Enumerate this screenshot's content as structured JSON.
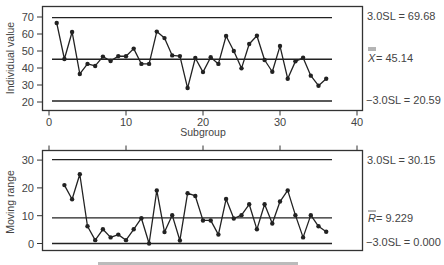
{
  "chart_data": [
    {
      "type": "line",
      "title": "Individuals chart",
      "xlabel": "Subgroup",
      "ylabel": "Individual value",
      "xlim": [
        0,
        40
      ],
      "ylim": [
        18,
        72
      ],
      "x_ticks": [
        0,
        10,
        20,
        30,
        40
      ],
      "y_ticks": [
        20,
        30,
        40,
        50,
        60,
        70
      ],
      "grid": false,
      "x": [
        1,
        2,
        3,
        4,
        5,
        6,
        7,
        8,
        9,
        10,
        11,
        12,
        13,
        14,
        15,
        16,
        17,
        18,
        19,
        20,
        21,
        22,
        23,
        24,
        25,
        26,
        27,
        28,
        29,
        30,
        31,
        32,
        33,
        34,
        35,
        36
      ],
      "values": [
        66.5,
        45.3,
        61.2,
        36.5,
        42.4,
        41.2,
        46.7,
        44.1,
        47.0,
        46.9,
        51.4,
        42.4,
        42.4,
        61.4,
        57.6,
        47.4,
        47.0,
        28.2,
        45.9,
        37.6,
        46.3,
        42.4,
        58.8,
        50.0,
        39.8,
        54.1,
        59.0,
        44.7,
        37.8,
        52.9,
        33.7,
        43.9,
        46.0,
        35.5,
        29.6,
        33.7
      ],
      "control_limits": {
        "ucl": {
          "label": "3.0SL = 69.68",
          "value": 69.68
        },
        "center": {
          "label": "X̿ = 45.14",
          "symbol": "X",
          "text": " = 45.14",
          "value": 45.14
        },
        "lcl": {
          "label": "−3.0SL = 20.59",
          "value": 20.59
        }
      }
    },
    {
      "type": "line",
      "title": "Moving range chart",
      "xlabel": "Subgroup",
      "ylabel": "Moving range",
      "xlim": [
        0,
        40
      ],
      "ylim": [
        -1,
        33
      ],
      "y_ticks": [
        0,
        10,
        20,
        30
      ],
      "grid": false,
      "x": [
        2,
        3,
        4,
        5,
        6,
        7,
        8,
        9,
        10,
        11,
        12,
        13,
        14,
        15,
        16,
        17,
        18,
        19,
        20,
        21,
        22,
        23,
        24,
        25,
        26,
        27,
        28,
        29,
        30,
        31,
        32,
        33,
        34,
        35,
        36
      ],
      "values": [
        21.0,
        15.9,
        24.9,
        6.2,
        1.2,
        5.1,
        2.2,
        3.2,
        1.2,
        5.1,
        9.1,
        0.0,
        19.1,
        4.1,
        10.2,
        1.1,
        18.1,
        17.1,
        8.3,
        8.3,
        3.2,
        16.0,
        9.0,
        10.2,
        14.1,
        5.1,
        14.1,
        7.2,
        15.1,
        19.1,
        10.2,
        2.2,
        10.2,
        6.2,
        4.2
      ],
      "control_limits": {
        "ucl": {
          "label": "3.0SL = 30.15",
          "value": 30.15
        },
        "center": {
          "label": "R̄ = 9.229",
          "symbol": "R",
          "text": " = 9.229",
          "value": 9.229
        },
        "lcl": {
          "label": "−3.0SL = 0.000",
          "value": 0.0
        }
      }
    }
  ],
  "labels": {
    "top_ylabel": "Individual value",
    "bottom_ylabel": "Moving range",
    "xlabel": "Subgroup",
    "top_ucl": "3.0SL = 69.68",
    "top_center_symbol": "X",
    "top_center_text": " = 45.14",
    "top_lcl": "−3.0SL = 20.59",
    "bottom_ucl": "3.0SL = 30.15",
    "bottom_center_symbol": "R",
    "bottom_center_text": " = 9.229",
    "bottom_lcl": "−3.0SL = 0.000",
    "x_ticks": [
      "0",
      "10",
      "20",
      "30",
      "40"
    ],
    "top_y_ticks": [
      "70",
      "60",
      "50",
      "40",
      "30",
      "20"
    ],
    "bottom_y_ticks": [
      "30",
      "20",
      "10",
      "0"
    ]
  },
  "colors": {
    "line": "#222222",
    "frame": "#333333",
    "text": "#444444"
  }
}
